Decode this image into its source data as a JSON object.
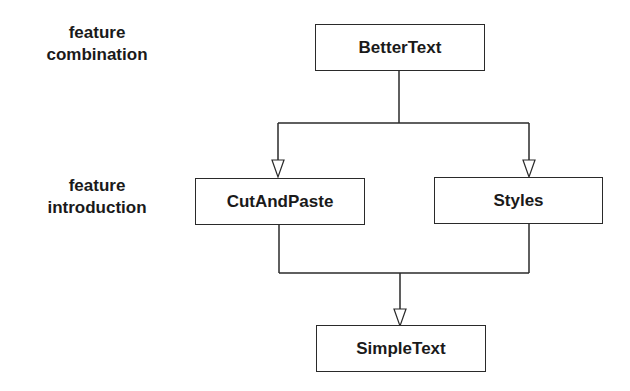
{
  "labels": {
    "combination": {
      "line1": "feature",
      "line2": "combination"
    },
    "introduction": {
      "line1": "feature",
      "line2": "introduction"
    }
  },
  "nodes": {
    "top": "BetterText",
    "left": "CutAndPaste",
    "right": "Styles",
    "bottom": "SimpleText"
  },
  "edges": [
    {
      "from": "BetterText",
      "to": "CutAndPaste",
      "style": "hollow-arrow"
    },
    {
      "from": "BetterText",
      "to": "Styles",
      "style": "hollow-arrow"
    },
    {
      "from": "CutAndPaste",
      "to": "SimpleText",
      "style": "hollow-arrow"
    },
    {
      "from": "Styles",
      "to": "SimpleText",
      "style": "hollow-arrow"
    }
  ],
  "colors": {
    "line": "#2a2a2a",
    "background": "#ffffff"
  }
}
